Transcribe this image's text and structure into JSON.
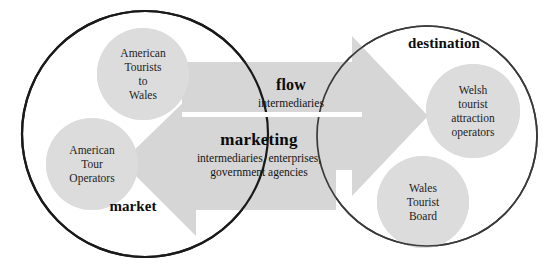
{
  "diagram": {
    "palette": {
      "background": "#ffffff",
      "outline": "#1a1a1a",
      "circle_fill": "#d9d9d9",
      "arrow_fill": "#d4d4d4",
      "text": "#121212"
    },
    "zones": [
      {
        "id": "market",
        "label": "market",
        "label_x": 133,
        "label_y": 206,
        "cx": 145,
        "cy": 134,
        "r": 123
      },
      {
        "id": "destination",
        "label": "destination",
        "label_x": 444,
        "label_y": 43,
        "cx": 427,
        "cy": 136,
        "r": 110
      }
    ],
    "nodes": [
      {
        "id": "american-tourists-to-wales",
        "zone": "market",
        "cx": 143,
        "cy": 74,
        "r": 46,
        "lines": [
          "American",
          "Tourists",
          "to",
          "Wales"
        ]
      },
      {
        "id": "american-tour-operators",
        "zone": "market",
        "cx": 92,
        "cy": 164,
        "r": 46,
        "lines": [
          "American",
          "Tour",
          "Operators"
        ]
      },
      {
        "id": "welsh-tourist-attraction-operators",
        "zone": "destination",
        "cx": 473,
        "cy": 111,
        "r": 47,
        "lines": [
          "Welsh",
          "tourist",
          "attraction",
          "operators"
        ]
      },
      {
        "id": "wales-tourist-board",
        "zone": "destination",
        "cx": 423,
        "cy": 202,
        "r": 46,
        "lines": [
          "Wales",
          "Tourist",
          "Board"
        ]
      }
    ],
    "arrows": [
      {
        "id": "flow-arrow",
        "direction": "right",
        "title": "flow",
        "subtitle": "intermediaries",
        "title_x": 291,
        "title_y": 85,
        "subtitle_x": 291,
        "subtitle_y": 103
      },
      {
        "id": "marketing-arrow",
        "direction": "left",
        "title": "marketing",
        "subtitle_lines": [
          "intermediaries, enterprises,",
          "government agencies"
        ],
        "title_x": 259,
        "title_y": 140,
        "subtitle_x": 259,
        "subtitle_y": 165
      }
    ]
  }
}
